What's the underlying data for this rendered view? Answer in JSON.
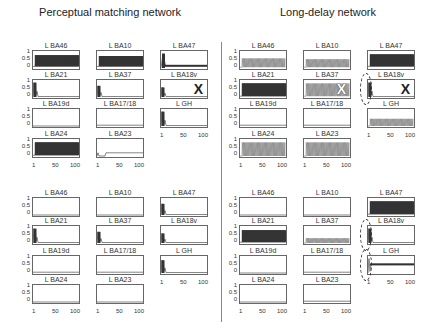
{
  "titles": {
    "left": "Perceptual matching network",
    "right": "Long-delay network"
  },
  "y_ticks": [
    "1",
    "0.5",
    "0"
  ],
  "x_ticks": [
    "1",
    "50",
    "100"
  ],
  "chart_data": [
    {
      "type": "line",
      "title": "Perceptual matching network (top)",
      "x_range": [
        1,
        100
      ],
      "ylim": [
        0,
        1
      ],
      "panels": [
        {
          "name": "L BA46",
          "pattern": "oscillation",
          "amplitude": 0.8,
          "baseline": 0.1,
          "style": "dense",
          "marker": ""
        },
        {
          "name": "L BA10",
          "pattern": "oscillation",
          "amplitude": 0.75,
          "baseline": 0.1,
          "style": "dense",
          "marker": ""
        },
        {
          "name": "L BA47",
          "pattern": "spike_then_low",
          "amplitude": 0.9,
          "baseline": 0.15,
          "style": "dense",
          "marker": ""
        },
        {
          "name": "L BA21",
          "pattern": "spike_decay",
          "amplitude": 0.9,
          "baseline": 0.05,
          "style": "dense",
          "marker": ""
        },
        {
          "name": "L BA37",
          "pattern": "spike_decay",
          "amplitude": 0.7,
          "baseline": 0.0,
          "style": "dense",
          "marker": ""
        },
        {
          "name": "L BA18v",
          "pattern": "spike_decay",
          "amplitude": 0.6,
          "baseline": 0.0,
          "style": "dense",
          "marker": "X"
        },
        {
          "name": "L BA19d",
          "pattern": "flat",
          "amplitude": 0.0,
          "baseline": 0.0,
          "style": "dense",
          "marker": ""
        },
        {
          "name": "L BA17/18",
          "pattern": "flat",
          "amplitude": 0.05,
          "baseline": 0.0,
          "style": "dense",
          "marker": ""
        },
        {
          "name": "L GH",
          "pattern": "spike_decay",
          "amplitude": 0.9,
          "baseline": 0.0,
          "style": "dense",
          "marker": ""
        },
        {
          "name": "L BA24",
          "pattern": "oscillation",
          "amplitude": 0.85,
          "baseline": 0.05,
          "style": "dense",
          "marker": ""
        },
        {
          "name": "L BA23",
          "pattern": "low_plateau",
          "amplitude": 0.2,
          "baseline": 0.0,
          "style": "dense",
          "marker": ""
        }
      ]
    },
    {
      "type": "line",
      "title": "Long-delay network (top)",
      "x_range": [
        1,
        100
      ],
      "ylim": [
        0,
        1
      ],
      "panels": [
        {
          "name": "L BA46",
          "pattern": "oscillation",
          "amplitude": 0.6,
          "baseline": 0.05,
          "style": "comb",
          "marker": ""
        },
        {
          "name": "L BA10",
          "pattern": "oscillation",
          "amplitude": 0.55,
          "baseline": 0.05,
          "style": "comb",
          "marker": ""
        },
        {
          "name": "L BA47",
          "pattern": "oscillation",
          "amplitude": 0.85,
          "baseline": 0.1,
          "style": "dense",
          "marker": ""
        },
        {
          "name": "L BA21",
          "pattern": "oscillation",
          "amplitude": 0.85,
          "baseline": 0.05,
          "style": "dense",
          "marker": ""
        },
        {
          "name": "L BA37",
          "pattern": "oscillation",
          "amplitude": 0.85,
          "baseline": 0.05,
          "style": "comb",
          "marker": "X"
        },
        {
          "name": "L BA18v",
          "pattern": "spike_decay",
          "amplitude": 0.9,
          "baseline": 0.0,
          "style": "dense",
          "marker": "X",
          "circled": true
        },
        {
          "name": "L BA19d",
          "pattern": "flat",
          "amplitude": 0.05,
          "baseline": 0.0,
          "style": "dense",
          "marker": ""
        },
        {
          "name": "L BA17/18",
          "pattern": "flat",
          "amplitude": 0.05,
          "baseline": 0.0,
          "style": "dense",
          "marker": ""
        },
        {
          "name": "L GH",
          "pattern": "oscillation",
          "amplitude": 0.45,
          "baseline": 0.0,
          "style": "comb",
          "marker": ""
        },
        {
          "name": "L BA24",
          "pattern": "oscillation",
          "amplitude": 0.85,
          "baseline": 0.0,
          "style": "comb",
          "marker": ""
        },
        {
          "name": "L BA23",
          "pattern": "oscillation",
          "amplitude": 0.85,
          "baseline": 0.0,
          "style": "comb",
          "marker": ""
        }
      ]
    },
    {
      "type": "line",
      "title": "Perceptual matching network (bottom)",
      "x_range": [
        1,
        100
      ],
      "ylim": [
        0,
        1
      ],
      "panels": [
        {
          "name": "L BA46",
          "pattern": "flat",
          "amplitude": 0.0,
          "baseline": 0.0,
          "style": "dense",
          "marker": ""
        },
        {
          "name": "L BA10",
          "pattern": "flat",
          "amplitude": 0.0,
          "baseline": 0.0,
          "style": "dense",
          "marker": ""
        },
        {
          "name": "L BA47",
          "pattern": "spike_decay",
          "amplitude": 0.7,
          "baseline": 0.0,
          "style": "dense",
          "marker": ""
        },
        {
          "name": "L BA21",
          "pattern": "spike_decay",
          "amplitude": 0.9,
          "baseline": 0.0,
          "style": "dense",
          "marker": ""
        },
        {
          "name": "L BA37",
          "pattern": "spike_decay",
          "amplitude": 0.7,
          "baseline": 0.0,
          "style": "dense",
          "marker": ""
        },
        {
          "name": "L BA18v",
          "pattern": "spike_decay",
          "amplitude": 0.6,
          "baseline": 0.0,
          "style": "dense",
          "marker": ""
        },
        {
          "name": "L BA19d",
          "pattern": "flat",
          "amplitude": 0.05,
          "baseline": 0.0,
          "style": "dense",
          "marker": ""
        },
        {
          "name": "L BA17/18",
          "pattern": "flat",
          "amplitude": 0.05,
          "baseline": 0.0,
          "style": "dense",
          "marker": ""
        },
        {
          "name": "L GH",
          "pattern": "spike_decay",
          "amplitude": 0.8,
          "baseline": 0.0,
          "style": "dense",
          "marker": ""
        },
        {
          "name": "L BA24",
          "pattern": "flat",
          "amplitude": 0.0,
          "baseline": 0.0,
          "style": "dense",
          "marker": ""
        },
        {
          "name": "L BA23",
          "pattern": "flat",
          "amplitude": 0.0,
          "baseline": 0.0,
          "style": "dense",
          "marker": ""
        }
      ]
    },
    {
      "type": "line",
      "title": "Long-delay network (bottom)",
      "x_range": [
        1,
        100
      ],
      "ylim": [
        0,
        1
      ],
      "panels": [
        {
          "name": "L BA46",
          "pattern": "flat",
          "amplitude": 0.0,
          "baseline": 0.0,
          "style": "dense",
          "marker": ""
        },
        {
          "name": "L BA10",
          "pattern": "flat",
          "amplitude": 0.0,
          "baseline": 0.0,
          "style": "dense",
          "marker": ""
        },
        {
          "name": "L BA47",
          "pattern": "oscillation",
          "amplitude": 0.85,
          "baseline": 0.05,
          "style": "dense",
          "marker": ""
        },
        {
          "name": "L BA21",
          "pattern": "oscillation",
          "amplitude": 0.8,
          "baseline": 0.05,
          "style": "dense",
          "marker": ""
        },
        {
          "name": "L BA37",
          "pattern": "oscillation",
          "amplitude": 0.3,
          "baseline": 0.0,
          "style": "comb",
          "marker": ""
        },
        {
          "name": "L BA18v",
          "pattern": "spike_decay",
          "amplitude": 0.9,
          "baseline": 0.0,
          "style": "dense",
          "marker": "",
          "circled": true
        },
        {
          "name": "L BA19d",
          "pattern": "flat",
          "amplitude": 0.0,
          "baseline": 0.0,
          "style": "dense",
          "marker": ""
        },
        {
          "name": "L BA17/18",
          "pattern": "flat",
          "amplitude": 0.05,
          "baseline": 0.0,
          "style": "dense",
          "marker": ""
        },
        {
          "name": "L GH",
          "pattern": "spike_then_plateau",
          "amplitude": 0.9,
          "baseline": 0.55,
          "style": "dense",
          "marker": "",
          "circled": true
        },
        {
          "name": "L BA24",
          "pattern": "flat",
          "amplitude": 0.0,
          "baseline": 0.0,
          "style": "dense",
          "marker": ""
        },
        {
          "name": "L BA23",
          "pattern": "flat",
          "amplitude": 0.05,
          "baseline": 0.0,
          "style": "dense",
          "marker": ""
        }
      ]
    }
  ]
}
